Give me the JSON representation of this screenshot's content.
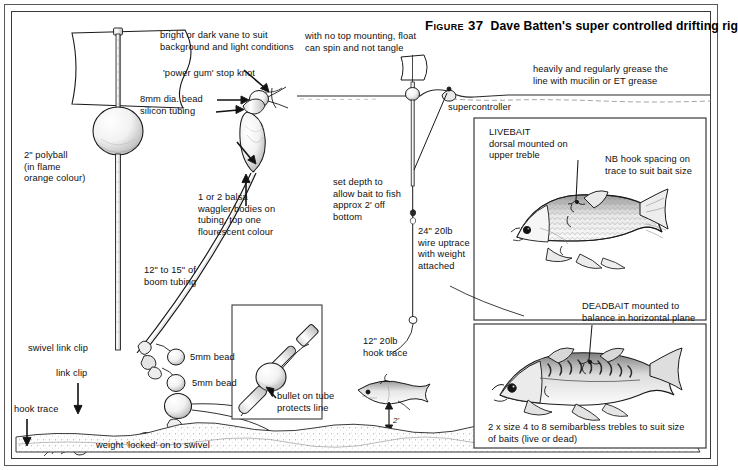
{
  "figure": {
    "number_label": "Figure 37",
    "title": "Dave Batten's super controlled drifting rig"
  },
  "labels": {
    "vane": "bright or dark vane to suit\nbackground and light conditions",
    "stop_knot": "'power gum' stop knot",
    "bead_8mm": "8mm dia. bead",
    "silicon_tubing": "silicon tubing",
    "polyball": "2\" polyball\n(in flame\norange colour)",
    "waggler": "1 or 2 balsa\nwaggler bodies on\ntubing, top one\nflourescent colour",
    "boom_tubing": "12\" to 15\" of\nboom tubing",
    "swivel_link_clip": "swivel link clip",
    "bead_5mm_upper": "5mm bead",
    "bead_5mm_lower": "5mm bead",
    "link_clip": "link clip",
    "hook_trace_left": "hook trace",
    "weight_locked": "weight 'locked' on to swivel",
    "no_top_mounting": "with no top mounting, float\ncan spin and not tangle",
    "set_depth": "set depth to\nallow bait to fish\napprox 2' off\nbottom",
    "uptrace": "24\" 20lb\nwire uptrace\nwith weight\nattached",
    "supercontroller": "supercontroller",
    "grease": "heavily and regularly grease the\nline with mucilin or ET grease",
    "bullet_on_tube": "bullet on tube\nprotects line",
    "hook_trace_12": "12\" 20lb\nhook trace",
    "depth_off_bottom": "2'",
    "livebait": "LIVEBAIT\ndorsal mounted on\nupper treble",
    "nb_hook_spacing": "NB hook spacing on\ntrace to suit bait size",
    "deadbait": "DEADBAIT mounted to\nbalance in horizontal plane",
    "trebles": "2 x size 4 to 8 semibarbless trebles to suit size\nof baits (live or dead)"
  },
  "colors": {
    "ink": "#101010",
    "frame": "#3a3a3c",
    "frame_outer": "#58585a",
    "paper": "#ffffff",
    "shade": "#bdbdbd"
  },
  "diagram": {
    "waterline_note": "horizontal wavy water surface line across upper area",
    "lakebed_note": "stippled lake bed across bottom",
    "items": [
      "drifter float with vane",
      "polyball",
      "balsa waggler bodies",
      "boom tubing",
      "swivel link clip and beads",
      "hook trace with trebles",
      "bullet on tube detail inset",
      "livebait roach inset",
      "deadbait mackerel inset"
    ]
  }
}
